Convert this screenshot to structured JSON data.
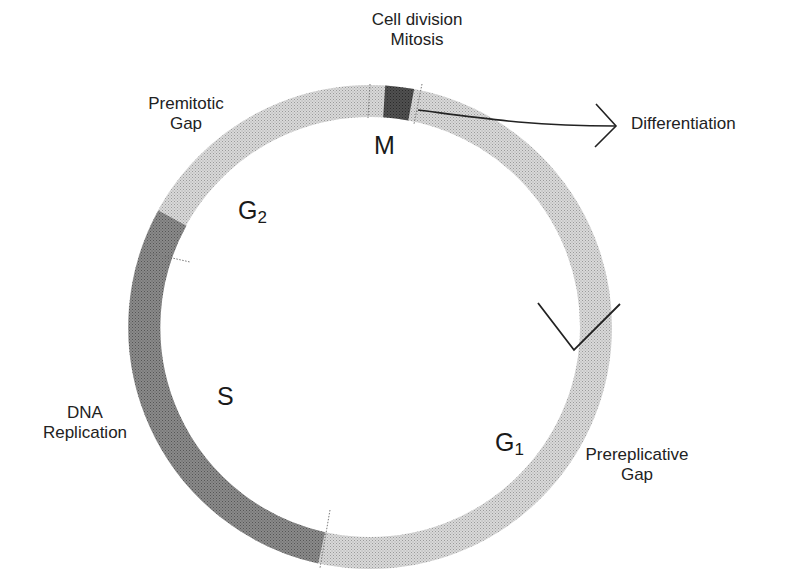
{
  "diagram": {
    "ring": {
      "center": [
        370,
        327
      ],
      "radius": 226,
      "thickness": 32,
      "colors": {
        "light": "#c4c4c4",
        "dark": "#7a7a7a",
        "mitosis": "#474747"
      }
    },
    "phases": [
      {
        "id": "M",
        "label": "M",
        "subscript": "",
        "description_lines": [
          "Cell division",
          "Mitosis"
        ],
        "shade": "mitosis"
      },
      {
        "id": "G1",
        "label": "G",
        "subscript": "1",
        "description_lines": [
          "Prereplicative",
          "Gap"
        ],
        "shade": "light"
      },
      {
        "id": "S",
        "label": "S",
        "subscript": "",
        "description_lines": [
          "DNA",
          "Replication"
        ],
        "shade": "dark"
      },
      {
        "id": "G2",
        "label": "G",
        "subscript": "2",
        "description_lines": [
          "Premitotic",
          "Gap"
        ],
        "shade": "light"
      }
    ],
    "exit_arrow": {
      "label": "Differentiation"
    },
    "restriction_point_marker": "checkpoint-v-marker"
  }
}
